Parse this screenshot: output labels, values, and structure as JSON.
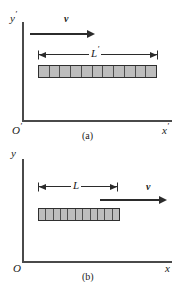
{
  "figure": {
    "type": "length-contraction-diagram",
    "panels": [
      {
        "id": "a",
        "caption": "(a)",
        "frame": "rest frame of the rod",
        "axes": {
          "y_label": "y",
          "y_prime": "′",
          "x_label": "x",
          "x_prime": "′",
          "origin_label": "O",
          "origin_prime": "′"
        },
        "velocity": {
          "label": "v",
          "direction": "right"
        },
        "dimension": {
          "label": "L",
          "prime": "′",
          "span_px": 118
        },
        "rod": {
          "segments": 11,
          "length_px": 119,
          "fill_color": "#bdbdbd",
          "edge_color": "#2f2f2f"
        }
      },
      {
        "id": "b",
        "caption": "(b)",
        "frame": "laboratory frame",
        "axes": {
          "y_label": "y",
          "y_prime": "",
          "x_label": "x",
          "x_prime": "",
          "origin_label": "O",
          "origin_prime": ""
        },
        "velocity": {
          "label": "v",
          "direction": "right"
        },
        "dimension": {
          "label": "L",
          "prime": "",
          "span_px": 78
        },
        "rod": {
          "segments": 11,
          "length_px": 82,
          "fill_color": "#bdbdbd",
          "edge_color": "#2f2f2f"
        }
      }
    ],
    "colors": {
      "axis": "#4a4a4a",
      "arrow": "#2b2b2b",
      "rod_fill": "#bdbdbd",
      "rod_edge": "#2f2f2f",
      "text": "#1a1a1a",
      "background": "#ffffff"
    }
  }
}
